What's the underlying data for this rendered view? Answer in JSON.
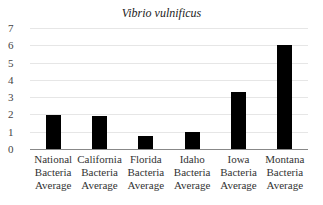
{
  "chart_data": {
    "type": "bar",
    "title": "Vibrio vulnificus",
    "xlabel": "",
    "ylabel": "",
    "ylim": [
      0,
      7
    ],
    "yticks": [
      "0",
      "1",
      "2",
      "3",
      "4",
      "5",
      "6",
      "7"
    ],
    "grid": true,
    "legend": null,
    "categories": [
      "National Bacteria Average",
      "California Bacteria Average",
      "Florida Bacteria Average",
      "Idaho Bacteria Average",
      "Iowa Bacteria Average",
      "Montana Bacteria Average"
    ],
    "category_lines": [
      [
        "National",
        "Bacteria",
        "Average"
      ],
      [
        "California",
        "Bacteria",
        "Average"
      ],
      [
        "Florida",
        "Bacteria",
        "Average"
      ],
      [
        "Idaho",
        "Bacteria",
        "Average"
      ],
      [
        "Iowa",
        "Bacteria",
        "Average"
      ],
      [
        "Montana",
        "Bacteria",
        "Average"
      ]
    ],
    "values": [
      1.95,
      1.9,
      0.75,
      1.0,
      3.3,
      6.0
    ],
    "bar_color": "#000000"
  }
}
